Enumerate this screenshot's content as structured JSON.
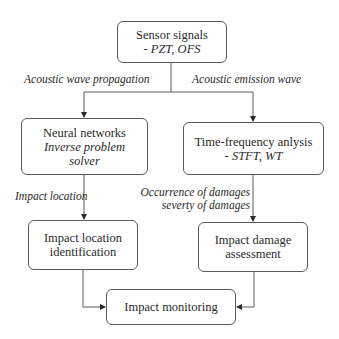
{
  "diagram": {
    "nodes": {
      "sensor": {
        "title": "Sensor signals",
        "sub": "- PZT, OFS"
      },
      "neural": {
        "title": "Neural networks",
        "sub1": "Inverse problem",
        "sub2": "solver"
      },
      "tf": {
        "title": "Time-frequency anlysis",
        "sub": "- STFT, WT"
      },
      "location": {
        "line1": "Impact location",
        "line2": "identification"
      },
      "damage": {
        "line1": "Impact damage",
        "line2": "assessment"
      },
      "monitoring": {
        "title": "Impact monitoring"
      }
    },
    "edges": {
      "left_branch": "Acoustic wave propagation",
      "right_branch": "Acoustic emission wave",
      "neural_to_location": "Impact location",
      "tf_to_damage_1": "Occurrence of damages",
      "tf_to_damage_2": "severty of damages"
    },
    "colors": {
      "line": "#5a5a5a",
      "text": "#2a2a2a",
      "background": "#ffffff"
    }
  }
}
